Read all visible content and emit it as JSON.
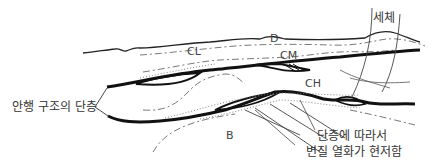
{
  "diagram": {
    "labels": {
      "CL": "CL",
      "D": "D",
      "CM": "CM",
      "CH": "CH",
      "B": "B",
      "weathered": "세체",
      "fault_left": "안행 구조의 단층",
      "note_line1": "단층에 따라서",
      "note_line2": "변질 열화가 현저함"
    },
    "colors": {
      "line": "#111111",
      "thin_line": "#444444",
      "text": "#333333",
      "background": "#ffffff"
    }
  }
}
